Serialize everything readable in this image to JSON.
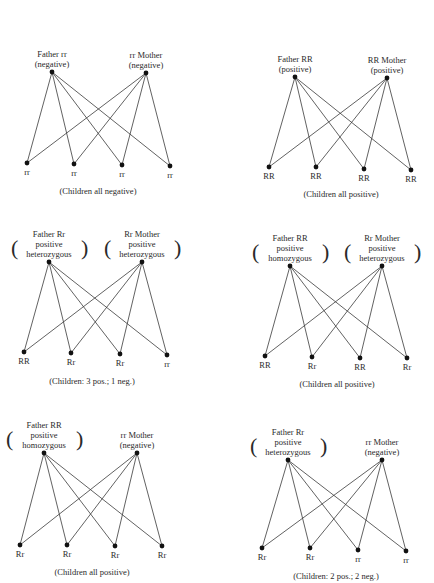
{
  "panels": [
    {
      "father": {
        "label": "Father rr",
        "sub": [
          "(negative)"
        ],
        "genotype": "rr",
        "x": 52,
        "y": 72
      },
      "mother": {
        "label": "rr Mother",
        "sub": [
          "(negative)"
        ],
        "genotype": "rr",
        "x": 146,
        "y": 73
      },
      "children": [
        {
          "genotype": "rr",
          "x": 27,
          "y": 163
        },
        {
          "genotype": "rr",
          "x": 74,
          "y": 164
        },
        {
          "genotype": "rr",
          "x": 122,
          "y": 165
        },
        {
          "genotype": "rr",
          "x": 170,
          "y": 166
        }
      ],
      "caption": "(Children all negative)",
      "caption_pos": {
        "x": 98,
        "y": 186
      }
    },
    {
      "father": {
        "label": "Father RR",
        "sub": [
          "(positive)"
        ],
        "genotype": "RR",
        "x": 295,
        "y": 77
      },
      "mother": {
        "label": "RR Mother",
        "sub": [
          "(positive)"
        ],
        "genotype": "RR",
        "x": 387,
        "y": 78
      },
      "children": [
        {
          "genotype": "RR",
          "x": 269,
          "y": 167
        },
        {
          "genotype": "RR",
          "x": 316,
          "y": 167
        },
        {
          "genotype": "RR",
          "x": 364,
          "y": 169
        },
        {
          "genotype": "RR",
          "x": 411,
          "y": 170
        }
      ],
      "caption": "(Children all positive)",
      "caption_pos": {
        "x": 341,
        "y": 189
      }
    },
    {
      "father": {
        "label": "Father Rr",
        "sub": [
          "positive",
          "heterozygous"
        ],
        "genotype": "Rr",
        "x": 49,
        "y": 262
      },
      "mother": {
        "label": "Rr Mother",
        "sub": [
          "positive",
          "heterozygous"
        ],
        "genotype": "Rr",
        "x": 142,
        "y": 262
      },
      "children": [
        {
          "genotype": "RR",
          "x": 24,
          "y": 352
        },
        {
          "genotype": "Rr",
          "x": 71,
          "y": 353
        },
        {
          "genotype": "Rr",
          "x": 120,
          "y": 354
        },
        {
          "genotype": "rr",
          "x": 167,
          "y": 355
        }
      ],
      "caption": "(Children: 3 pos.; 1 neg.)",
      "caption_pos": {
        "x": 92,
        "y": 376
      }
    },
    {
      "father": {
        "label": "Father RR",
        "sub": [
          "positive",
          "homozygous"
        ],
        "genotype": "RR",
        "x": 290,
        "y": 266
      },
      "mother": {
        "label": "Rr Mother",
        "sub": [
          "positive",
          "heterozygous"
        ],
        "genotype": "Rr",
        "x": 382,
        "y": 266
      },
      "children": [
        {
          "genotype": "RR",
          "x": 265,
          "y": 356
        },
        {
          "genotype": "Rr",
          "x": 312,
          "y": 357
        },
        {
          "genotype": "RR",
          "x": 360,
          "y": 358
        },
        {
          "genotype": "Rr",
          "x": 407,
          "y": 358
        }
      ],
      "caption": "(Children all positive)",
      "caption_pos": {
        "x": 337,
        "y": 379
      }
    },
    {
      "father": {
        "label": "Father RR",
        "sub": [
          "positive",
          "homozygous"
        ],
        "genotype": "RR",
        "x": 44,
        "y": 453
      },
      "mother": {
        "label": "rr Mother",
        "sub": [
          "(negative)"
        ],
        "genotype": "rr",
        "x": 137,
        "y": 453
      },
      "children": [
        {
          "genotype": "Rr",
          "x": 20,
          "y": 545
        },
        {
          "genotype": "Rr",
          "x": 67,
          "y": 545
        },
        {
          "genotype": "Rr",
          "x": 115,
          "y": 546
        },
        {
          "genotype": "Rr",
          "x": 162,
          "y": 546
        }
      ],
      "caption": "(Children all positive)",
      "caption_pos": {
        "x": 92,
        "y": 567
      }
    },
    {
      "father": {
        "label": "Father Rr",
        "sub": [
          "positive",
          "heterozygous"
        ],
        "genotype": "Rr",
        "x": 288,
        "y": 460
      },
      "mother": {
        "label": "rr Mother",
        "sub": [
          "(negative)"
        ],
        "genotype": "rr",
        "x": 382,
        "y": 460
      },
      "children": [
        {
          "genotype": "Rr",
          "x": 262,
          "y": 548
        },
        {
          "genotype": "Rr",
          "x": 310,
          "y": 548
        },
        {
          "genotype": "rr",
          "x": 358,
          "y": 550
        },
        {
          "genotype": "rr",
          "x": 406,
          "y": 551
        }
      ],
      "caption": "(Children: 2 pos.; 2 neg.)",
      "caption_pos": {
        "x": 336,
        "y": 571
      }
    }
  ],
  "colors": {
    "line": "#3a3a3a",
    "dot": "#111111",
    "text": "#2a2a2a"
  }
}
